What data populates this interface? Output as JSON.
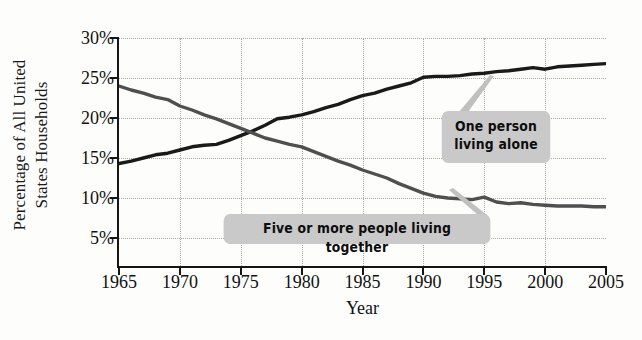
{
  "chart_data": {
    "type": "line",
    "title": "",
    "xlabel": "Year",
    "ylabel": "Percentage of All United States Households",
    "ylabel_line1": "Percentage of All United",
    "ylabel_line2": "States Households",
    "xlim": [
      1965,
      2005
    ],
    "ylim": [
      1.5,
      30
    ],
    "grid": true,
    "legend_position": "inline-callouts",
    "xticks": [
      "1965",
      "1970",
      "1975",
      "1980",
      "1985",
      "1990",
      "1995",
      "2000",
      "2005"
    ],
    "xtick_values": [
      1965,
      1970,
      1975,
      1980,
      1985,
      1990,
      1995,
      2000,
      2005
    ],
    "yticks": [
      "30%",
      "25%",
      "20%",
      "15%",
      "10%",
      "5%"
    ],
    "ytick_values": [
      30,
      25,
      20,
      15,
      10,
      5
    ],
    "x": [
      1965,
      1966,
      1967,
      1968,
      1969,
      1970,
      1971,
      1972,
      1973,
      1974,
      1975,
      1976,
      1977,
      1978,
      1979,
      1980,
      1981,
      1982,
      1983,
      1984,
      1985,
      1986,
      1987,
      1988,
      1989,
      1990,
      1991,
      1992,
      1993,
      1994,
      1995,
      1996,
      1997,
      1998,
      1999,
      2000,
      2001,
      2002,
      2003,
      2004,
      2005
    ],
    "series": [
      {
        "name": "One person living alone",
        "color": "#1a1a1a",
        "values": [
          14.3,
          14.6,
          15.0,
          15.4,
          15.6,
          16.0,
          16.4,
          16.6,
          16.7,
          17.2,
          17.8,
          18.4,
          19.1,
          19.9,
          20.1,
          20.4,
          20.8,
          21.3,
          21.7,
          22.3,
          22.8,
          23.1,
          23.6,
          24.0,
          24.4,
          25.1,
          25.2,
          25.2,
          25.3,
          25.5,
          25.6,
          25.8,
          25.9,
          26.1,
          26.3,
          26.1,
          26.4,
          26.5,
          26.6,
          26.7,
          26.8
        ]
      },
      {
        "name": "Five or more people living together",
        "color": "#4f4f4f",
        "values": [
          24.0,
          23.5,
          23.1,
          22.6,
          22.3,
          21.5,
          21.0,
          20.4,
          19.9,
          19.3,
          18.7,
          18.1,
          17.5,
          17.1,
          16.7,
          16.4,
          15.8,
          15.2,
          14.6,
          14.1,
          13.5,
          13.0,
          12.5,
          11.8,
          11.2,
          10.6,
          10.2,
          10.0,
          9.9,
          9.8,
          10.1,
          9.5,
          9.3,
          9.4,
          9.2,
          9.1,
          9.0,
          9.0,
          9.0,
          8.9,
          8.9
        ]
      }
    ],
    "annotations": [
      {
        "id": "one-person",
        "text_line1": "One person",
        "text_line2": "living alone",
        "anchor_year": 1995,
        "anchor_value": 25.6
      },
      {
        "id": "five-or-more",
        "text_line1": "Five or more people living together",
        "anchor_year": 1989,
        "anchor_value": 11.2
      }
    ]
  },
  "axes": {
    "ylabel_line1": "Percentage of All United",
    "ylabel_line2": "States Households",
    "xlabel": "Year",
    "yticks": [
      "30%",
      "25%",
      "20%",
      "15%",
      "10%",
      "5%"
    ],
    "xticks": [
      "1965",
      "1970",
      "1975",
      "1980",
      "1985",
      "1990",
      "1995",
      "2000",
      "2005"
    ]
  },
  "callouts": {
    "one_person": {
      "line1": "One person",
      "line2": "living alone"
    },
    "five_or_more": {
      "line1": "Five or more people living together"
    }
  },
  "colors": {
    "line_one_person": "#1a1a1a",
    "line_five_or_more": "#4f4f4f",
    "callout_bg": "#c9c9c9",
    "grid": "#a9a9a9",
    "axis": "#151515",
    "background": "#fdfdfc"
  }
}
